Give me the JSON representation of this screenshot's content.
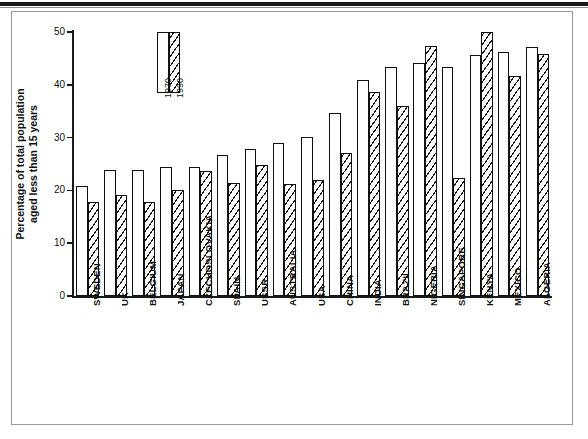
{
  "figure": {
    "ylabel_line1": "Percentage of total population",
    "ylabel_line2": "aged less than 15 years",
    "legend": {
      "series1": "1970",
      "series2": "1990"
    }
  },
  "chart_data": {
    "type": "bar",
    "title": "",
    "xlabel": "",
    "ylabel": "Percentage of total population aged less than 15 years",
    "ylim": [
      0,
      50
    ],
    "yticks": [
      0,
      10,
      20,
      30,
      40,
      50
    ],
    "ytick_labels": [
      "0",
      "10",
      "20",
      "30",
      "40",
      "50"
    ],
    "grid": false,
    "legend_position": "upper-left-inside",
    "categories": [
      "SWEDEN",
      "UK",
      "BELGIUM",
      "JAPAN",
      "CZECHOSLOVAKIA",
      "SPAIN",
      "USSR",
      "AUSTRALIA",
      "USA",
      "CHINA",
      "INDIA",
      "BRAZIL",
      "NIGERIA",
      "SINGAPORE",
      "KENYA",
      "MEXICO",
      "ALGERIA"
    ],
    "series": [
      {
        "name": "1970",
        "fill": "white",
        "values": [
          20.8,
          23.8,
          23.8,
          24.5,
          24.4,
          26.7,
          27.9,
          28.9,
          30.2,
          34.7,
          40.9,
          43.3,
          44.1,
          43.4,
          45.7,
          46.2,
          47.2
        ]
      },
      {
        "name": "1990",
        "fill": "hatched",
        "values": [
          17.8,
          19.2,
          17.9,
          20.0,
          23.7,
          21.4,
          24.8,
          21.2,
          22.0,
          27.1,
          38.7,
          36.0,
          47.3,
          22.3,
          50.0,
          41.7,
          45.9
        ]
      }
    ]
  }
}
